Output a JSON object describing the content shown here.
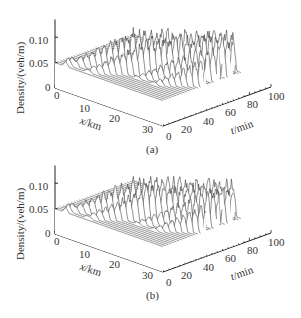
{
  "figure": {
    "panels": [
      {
        "id": "a",
        "caption": "(a)"
      },
      {
        "id": "b",
        "caption": "(b)"
      }
    ]
  },
  "axes": {
    "z_label": "Density/(veh/m)",
    "z_ticks": [
      "0",
      "0.05",
      "0.10"
    ],
    "x_label_var": "x",
    "x_label_unit": "/km",
    "x_ticks": [
      "0",
      "10",
      "20",
      "30"
    ],
    "t_label_var": "t",
    "t_label_unit": "/min",
    "t_ticks": [
      "0",
      "20",
      "40",
      "60",
      "80",
      "100"
    ]
  },
  "chart_data": [
    {
      "type": "area",
      "subtype": "3d-waterfall",
      "title": "(a)",
      "xlabel": "x/km",
      "ylabel": "t/min",
      "zlabel": "Density/(veh/m)",
      "xlim": [
        0,
        30
      ],
      "tlim": [
        0,
        100
      ],
      "zlim": [
        0,
        0.13
      ],
      "z_ticks": [
        0,
        0.05,
        0.1
      ],
      "x_ticks": [
        0,
        10,
        20,
        30
      ],
      "t_ticks": [
        0,
        20,
        40,
        60,
        80,
        100
      ],
      "baseline_density": 0.05,
      "num_traces": 30,
      "description": "Uniform density 0.05 veh/m with a small perturbation near x≈5 km at t=0 that grows into stop-and-go waves. Two dense bands of oscillating density peaks (~0.12-0.13 veh/m) propagate upstream as time increases.",
      "wave_bands": [
        {
          "t_start": 5,
          "t_end": 55,
          "peak_density": 0.13,
          "x_start": 5,
          "x_end": 30
        },
        {
          "t_start": 55,
          "t_end": 100,
          "peak_density": 0.12,
          "x_start": 0,
          "x_end": 20
        }
      ]
    },
    {
      "type": "area",
      "subtype": "3d-waterfall",
      "title": "(b)",
      "xlabel": "x/km",
      "ylabel": "t/min",
      "zlabel": "Density/(veh/m)",
      "xlim": [
        0,
        30
      ],
      "tlim": [
        0,
        100
      ],
      "zlim": [
        0,
        0.13
      ],
      "z_ticks": [
        0,
        0.05,
        0.1
      ],
      "x_ticks": [
        0,
        10,
        20,
        30
      ],
      "t_ticks": [
        0,
        20,
        40,
        60,
        80,
        100
      ],
      "baseline_density": 0.05,
      "num_traces": 30,
      "description": "Same setup as (a): a small initial perturbation grows into stop-and-go waves propagating upstream; the oscillation bands are slightly more regular, with peaks ~0.12 veh/m.",
      "wave_bands": [
        {
          "t_start": 5,
          "t_end": 55,
          "peak_density": 0.125,
          "x_start": 5,
          "x_end": 30
        },
        {
          "t_start": 55,
          "t_end": 100,
          "peak_density": 0.12,
          "x_start": 0,
          "x_end": 20
        }
      ]
    }
  ]
}
